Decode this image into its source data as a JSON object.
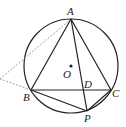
{
  "diagram": {
    "type": "geometry",
    "circle": {
      "center": "O",
      "cx": 71,
      "cy": 66,
      "r": 47
    },
    "points": {
      "A": {
        "label": "A",
        "x": 71,
        "y": 19
      },
      "B": {
        "label": "B",
        "x": 31,
        "y": 90
      },
      "C": {
        "label": "C",
        "x": 111,
        "y": 90
      },
      "D": {
        "label": "D",
        "x": 84,
        "y": 90
      },
      "P": {
        "label": "P",
        "x": 87,
        "y": 111
      },
      "O": {
        "label": "O",
        "x": 71,
        "y": 66
      },
      "E": {
        "x": 0,
        "y": 79
      }
    },
    "segments_solid": [
      "AB",
      "AC",
      "BC",
      "AP",
      "BP",
      "CP"
    ],
    "segments_dashed": [
      "AE",
      "BE"
    ],
    "colors": {
      "stroke": "#222222",
      "dashed": "#888888",
      "background": "#ffffff"
    }
  }
}
